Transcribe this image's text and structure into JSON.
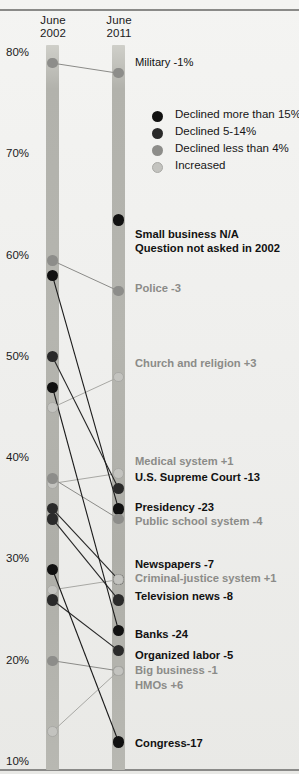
{
  "chart_data": {
    "type": "line",
    "title": "",
    "subtitle": "",
    "xlabel": "",
    "ylabel": "",
    "x": [
      "June 2002",
      "June 2011"
    ],
    "ylim": [
      10,
      80
    ],
    "yticks": [
      "80%",
      "70%",
      "60%",
      "50%",
      "40%",
      "30%",
      "20%",
      "10%"
    ],
    "ytick_values": [
      80,
      70,
      60,
      50,
      40,
      30,
      20,
      10
    ],
    "grid": false,
    "legend_position": "top-right",
    "legend": [
      {
        "label": "Declined more than 15%",
        "color": "#111111"
      },
      {
        "label": "Declined 5-14%",
        "color": "#2a2a2a"
      },
      {
        "label": "Declined less than 4%",
        "color": "#8d8d8a"
      },
      {
        "label": "Increased",
        "color": "#c3c3bf"
      }
    ],
    "series": [
      {
        "name": "Military",
        "label": "Military -1%",
        "v2002": 79.0,
        "v2011": 78.0,
        "change": -1,
        "tone": "light",
        "bold": false
      },
      {
        "name": "Small business",
        "label": "Small business N/A",
        "v2002": null,
        "v2011": 63.5,
        "change": null,
        "tone": "heavy",
        "bold": true,
        "note": "Question not asked in 2002"
      },
      {
        "name": "Police",
        "label": "Police -3",
        "v2002": 59.5,
        "v2011": 56.5,
        "change": -3,
        "tone": "light",
        "bold": false
      },
      {
        "name": "Church and religion",
        "label": "Church and religion +3",
        "v2002": 45.0,
        "v2011": 48.0,
        "change": 3,
        "tone": "increased",
        "bold": false
      },
      {
        "name": "Medical system",
        "label": "Medical system +1",
        "v2002": 37.5,
        "v2011": 38.5,
        "change": 1,
        "tone": "increased",
        "bold": false
      },
      {
        "name": "U.S. Supreme Court",
        "label": "U.S. Supreme Court -13",
        "v2002": 50.0,
        "v2011": 37.0,
        "change": -13,
        "tone": "mid",
        "bold": true
      },
      {
        "name": "Presidency",
        "label": "Presidency -23",
        "v2002": 58.0,
        "v2011": 35.0,
        "change": -23,
        "tone": "heavy",
        "bold": true
      },
      {
        "name": "Public school system",
        "label": "Public school system -4",
        "v2002": 38.0,
        "v2011": 34.0,
        "change": -4,
        "tone": "light",
        "bold": false
      },
      {
        "name": "Newspapers",
        "label": "Newspapers -7",
        "v2002": 35.0,
        "v2011": 28.0,
        "change": -7,
        "tone": "mid",
        "bold": true
      },
      {
        "name": "Criminal-justice system",
        "label": "Criminal-justice system +1",
        "v2002": 27.0,
        "v2011": 28.0,
        "change": 1,
        "tone": "increased",
        "bold": false
      },
      {
        "name": "Television news",
        "label": "Television news -8",
        "v2002": 34.0,
        "v2011": 26.0,
        "change": -8,
        "tone": "mid",
        "bold": true
      },
      {
        "name": "Banks",
        "label": "Banks -24",
        "v2002": 47.0,
        "v2011": 23.0,
        "change": -24,
        "tone": "heavy",
        "bold": true
      },
      {
        "name": "Organized labor",
        "label": "Organized labor -5",
        "v2002": 26.0,
        "v2011": 21.0,
        "change": -5,
        "tone": "mid",
        "bold": true
      },
      {
        "name": "Big business",
        "label": "Big business -1",
        "v2002": 20.0,
        "v2011": 19.0,
        "change": -1,
        "tone": "light",
        "bold": false
      },
      {
        "name": "HMOs",
        "label": "HMOs +6",
        "v2002": 13.0,
        "v2011": 19.0,
        "change": 6,
        "tone": "increased",
        "bold": false
      },
      {
        "name": "Congress",
        "label": "Congress-17",
        "v2002": 29.0,
        "v2011": 12.0,
        "change": -17,
        "tone": "heavy",
        "bold": true
      }
    ]
  },
  "header": {
    "col_2002_line1": "June",
    "col_2002_line2": "2002",
    "col_2011_line1": "June",
    "col_2011_line2": "2011"
  },
  "axis": {
    "t80": "80%",
    "t70": "70%",
    "t60": "60%",
    "t50": "50%",
    "t40": "40%",
    "t30": "30%",
    "t20": "20%",
    "t10": "10%"
  },
  "legend": {
    "item0": "Declined more than 15%",
    "item1": "Declined 5-14%",
    "item2": "Declined less than 4%",
    "item3": "Increased"
  },
  "labels": {
    "military": "Military -1%",
    "small_business": "Small business N/A",
    "small_business_note": "Question not asked in 2002",
    "police": "Police -3",
    "church": "Church and religion +3",
    "medical": "Medical system +1",
    "supreme_court": "U.S. Supreme Court -13",
    "presidency": "Presidency -23",
    "public_school": "Public school system -4",
    "newspapers": "Newspapers -7",
    "criminal_justice": "Criminal-justice system +1",
    "television_news": "Television news -8",
    "banks": "Banks -24",
    "organized_labor": "Organized labor -5",
    "big_business": "Big business -1",
    "hmos": "HMOs +6",
    "congress": "Congress-17"
  },
  "colors": {
    "declined_heavy": "#111111",
    "declined_mid": "#2a2a2a",
    "declined_light": "#8d8d8a",
    "increased": "#c3c3bf",
    "bar": "#b4b4ae",
    "background": "#f0f0ee"
  }
}
